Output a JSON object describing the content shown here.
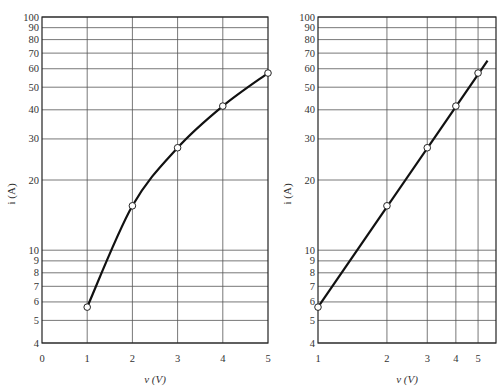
{
  "chart_data": [
    {
      "type": "line",
      "title": "",
      "xlabel": "v (V)",
      "ylabel": "i (A)",
      "x_scale": "linear",
      "y_scale": "log",
      "xlim": [
        0,
        5
      ],
      "ylim": [
        4,
        100
      ],
      "x_ticks": [
        "0",
        "1",
        "2",
        "3",
        "4",
        "5"
      ],
      "y_ticks": [
        "4",
        "5",
        "6",
        "7",
        "8",
        "9",
        "10",
        "20",
        "30",
        "40",
        "50",
        "60",
        "70",
        "80",
        "90",
        "100"
      ],
      "grid": true,
      "legend": null,
      "series": [
        {
          "name": "i vs v (semilog)",
          "x": [
            1,
            2,
            3,
            4,
            5
          ],
          "values": [
            5.7,
            15.5,
            27.5,
            41.5,
            57.5
          ],
          "markers": "open-circle",
          "style": "smooth-curve"
        }
      ]
    },
    {
      "type": "line",
      "title": "",
      "xlabel": "v (V)",
      "ylabel": "i (A)",
      "x_scale": "log",
      "y_scale": "log",
      "xlim": [
        1,
        5.6
      ],
      "ylim": [
        4,
        100
      ],
      "x_ticks": [
        "1",
        "2",
        "3",
        "4",
        "5"
      ],
      "y_ticks": [
        "4",
        "5",
        "6",
        "7",
        "8",
        "9",
        "10",
        "20",
        "30",
        "40",
        "50",
        "60",
        "70",
        "80",
        "90",
        "100"
      ],
      "grid": true,
      "legend": null,
      "series": [
        {
          "name": "i vs v (log-log)",
          "x": [
            1,
            2,
            3,
            4,
            5
          ],
          "values": [
            5.7,
            15.5,
            27.5,
            41.5,
            57.5
          ],
          "markers": "open-circle",
          "style": "straight-line",
          "line_extends_to": [
            5.5,
            65
          ]
        }
      ]
    }
  ]
}
